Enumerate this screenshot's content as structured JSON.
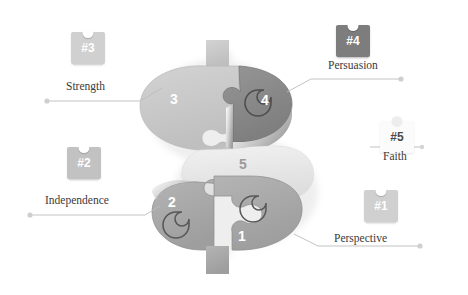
{
  "figure": {
    "shape_label": "dollar-sign-puzzle",
    "background": "#ffffff"
  },
  "palette": {
    "piece_light": "#c9c9c9",
    "piece_center": "#e8e8e8",
    "piece_mid": "#a9a9a9",
    "piece_dark": "#8a8a8a",
    "badge_light": "#d0d0d0",
    "badge_dark": "#7d7d7d",
    "badge_white": "#fbfbfb",
    "line": "#b8b8b8",
    "text": "#3a3a3a",
    "number_on_fill": "#ffffff",
    "number_on_white": "#9b9b9b"
  },
  "puzzle": {
    "pieces": [
      {
        "id": "piece-1",
        "number": "1",
        "tone": "mid"
      },
      {
        "id": "piece-2",
        "number": "2",
        "tone": "mid"
      },
      {
        "id": "piece-3",
        "number": "3",
        "tone": "light"
      },
      {
        "id": "piece-4",
        "number": "4",
        "tone": "dark"
      },
      {
        "id": "piece-5",
        "number": "5",
        "tone": "center"
      }
    ]
  },
  "callouts": [
    {
      "id": "callout-3",
      "badge": "#3",
      "label": "Strength",
      "badge_style": "light",
      "side": "left"
    },
    {
      "id": "callout-4",
      "badge": "#4",
      "label": "Persuasion",
      "badge_style": "dark",
      "side": "right"
    },
    {
      "id": "callout-2",
      "badge": "#2",
      "label": "Independence",
      "badge_style": "mid",
      "side": "left"
    },
    {
      "id": "callout-5",
      "badge": "#5",
      "label": "Faith",
      "badge_style": "white",
      "side": "right"
    },
    {
      "id": "callout-1",
      "badge": "#1",
      "label": "Perspective",
      "badge_style": "light",
      "side": "right"
    }
  ]
}
